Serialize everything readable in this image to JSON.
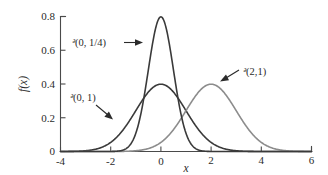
{
  "chart_data": {
    "type": "line",
    "title": "",
    "xlabel": "x",
    "ylabel": "f(x)",
    "xlim": [
      -4,
      6
    ],
    "ylim": [
      0,
      0.8
    ],
    "grid": false,
    "legend_position": "inline-annotations",
    "xticks": [
      "-4",
      "-2",
      "0",
      "2",
      "4",
      "6"
    ],
    "xtick_values": [
      -4,
      -2,
      0,
      2,
      4,
      6
    ],
    "yticks": [
      "0",
      "0.2",
      "0.4",
      "0.6",
      "0.8"
    ],
    "ytick_values": [
      0,
      0.2,
      0.4,
      0.6,
      0.8
    ],
    "series": [
      {
        "name": "N(0, 1/4)",
        "label": "ᵊ(0, 1/4)",
        "distribution": "normal",
        "mean": 0,
        "variance": 0.25,
        "sigma": 0.5,
        "peak_value": 0.7979,
        "color": "#3a3a3a",
        "x": [
          -4.0,
          -3.5,
          -3.0,
          -2.5,
          -2.0,
          -1.75,
          -1.5,
          -1.25,
          -1.0,
          -0.875,
          -0.75,
          -0.625,
          -0.5,
          -0.375,
          -0.25,
          -0.125,
          0.0,
          0.125,
          0.25,
          0.375,
          0.5,
          0.625,
          0.75,
          0.875,
          1.0,
          1.25,
          1.5,
          1.75,
          2.0,
          2.5,
          3.0,
          3.5,
          4.0,
          5.0,
          6.0
        ],
        "y": [
          0.0,
          0.0,
          0.0,
          0.0,
          0.0003,
          0.0022,
          0.0177,
          0.092,
          0.3183,
          0.5114,
          0.7041,
          0.8298,
          0.8279,
          0.686,
          0.4839,
          0.2803,
          0.7979,
          0.2803,
          0.4839,
          0.686,
          0.8279,
          0.8298,
          0.7041,
          0.5114,
          0.3183,
          0.092,
          0.0177,
          0.0022,
          0.0003,
          0.0,
          0.0,
          0.0,
          0.0,
          0.0,
          0.0
        ]
      },
      {
        "name": "N(0, 1)",
        "label": "ᵊ(0, 1)",
        "distribution": "normal",
        "mean": 0,
        "variance": 1,
        "sigma": 1,
        "peak_value": 0.3989,
        "color": "#3a3a3a",
        "x": [
          -4.0,
          -3.5,
          -3.0,
          -2.5,
          -2.0,
          -1.5,
          -1.0,
          -0.5,
          0.0,
          0.5,
          1.0,
          1.5,
          2.0,
          2.5,
          3.0,
          3.5,
          4.0,
          5.0,
          6.0
        ],
        "y": [
          0.0001,
          0.0009,
          0.0044,
          0.0175,
          0.054,
          0.1295,
          0.242,
          0.3521,
          0.3989,
          0.3521,
          0.242,
          0.1295,
          0.054,
          0.0175,
          0.0044,
          0.0009,
          0.0001,
          0.0,
          0.0
        ]
      },
      {
        "name": "N(2, 1)",
        "label": "ᵊ(2,1)",
        "distribution": "normal",
        "mean": 2,
        "variance": 1,
        "sigma": 1,
        "peak_value": 0.3989,
        "color": "#8c8c8c",
        "x": [
          -2.0,
          -1.5,
          -1.0,
          -0.5,
          0.0,
          0.5,
          1.0,
          1.5,
          2.0,
          2.5,
          3.0,
          3.5,
          4.0,
          4.5,
          5.0,
          5.5,
          6.0
        ],
        "y": [
          0.0001,
          0.0009,
          0.0044,
          0.0175,
          0.054,
          0.1295,
          0.242,
          0.3521,
          0.3989,
          0.3521,
          0.242,
          0.1295,
          0.054,
          0.0175,
          0.0044,
          0.0009,
          0.0001
        ]
      }
    ],
    "annotations": [
      {
        "name": "narrow-curve-annotation",
        "text": "ᵊ(0, 1/4)",
        "points_to": "N(0, 1/4) curve left flank",
        "arrow_direction": "right"
      },
      {
        "name": "standard-normal-annotation",
        "text": "ᵊ(0, 1)",
        "points_to": "N(0, 1) curve left tail",
        "arrow_direction": "down-right"
      },
      {
        "name": "shifted-normal-annotation",
        "text": "ᵊ(2,1)",
        "points_to": "N(2, 1) curve right shoulder",
        "arrow_direction": "down-left"
      }
    ],
    "colors": {
      "background": "#ffffff",
      "axis": "#4a4a4a",
      "text": "#2b2b2b",
      "curve_dark": "#3a3a3a",
      "curve_gray": "#8c8c8c"
    }
  },
  "labels": {
    "y_axis_title": "f(x)",
    "x_axis_title": "x",
    "ytick_0": "0",
    "ytick_1": "0.2",
    "ytick_2": "0.4",
    "ytick_3": "0.6",
    "ytick_4": "0.8",
    "xtick_0": "-4",
    "xtick_1": "-2",
    "xtick_2": "0",
    "xtick_3": "2",
    "xtick_4": "4",
    "xtick_5": "6",
    "ann_narrow_N": "ᵊ",
    "ann_narrow_rest": "(0, 1/4)",
    "ann_std_N": "ᵊ",
    "ann_std_rest": "(0, 1)",
    "ann_shift_N": "ᵊ",
    "ann_shift_rest": "(2,1)"
  }
}
